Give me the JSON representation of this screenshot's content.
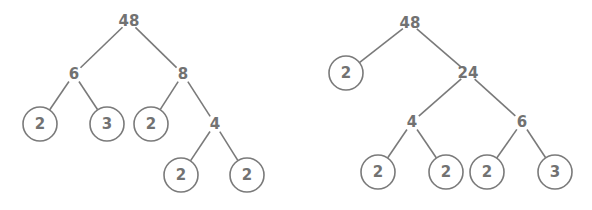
{
  "diagram": {
    "type": "factor-trees",
    "colors": {
      "stroke": "#7a7a7a",
      "text": "#727272",
      "background": "#ffffff"
    },
    "trees": [
      {
        "root": "48",
        "nodes": [
          {
            "id": "n0",
            "label": "48",
            "x": 129,
            "y": 21,
            "prime": false
          },
          {
            "id": "n1",
            "label": "6",
            "x": 74,
            "y": 74,
            "prime": false
          },
          {
            "id": "n2",
            "label": "8",
            "x": 183,
            "y": 74,
            "prime": false
          },
          {
            "id": "n3",
            "label": "2",
            "x": 40,
            "y": 124,
            "prime": true
          },
          {
            "id": "n4",
            "label": "3",
            "x": 107,
            "y": 124,
            "prime": true
          },
          {
            "id": "n5",
            "label": "2",
            "x": 151,
            "y": 124,
            "prime": true
          },
          {
            "id": "n6",
            "label": "4",
            "x": 215,
            "y": 124,
            "prime": false
          },
          {
            "id": "n7",
            "label": "2",
            "x": 181,
            "y": 175,
            "prime": true
          },
          {
            "id": "n8",
            "label": "2",
            "x": 247,
            "y": 175,
            "prime": true
          }
        ],
        "edges": [
          [
            "n0",
            "n1"
          ],
          [
            "n0",
            "n2"
          ],
          [
            "n1",
            "n3"
          ],
          [
            "n1",
            "n4"
          ],
          [
            "n2",
            "n5"
          ],
          [
            "n2",
            "n6"
          ],
          [
            "n6",
            "n7"
          ],
          [
            "n6",
            "n8"
          ]
        ]
      },
      {
        "root": "48",
        "nodes": [
          {
            "id": "m0",
            "label": "48",
            "x": 410,
            "y": 23,
            "prime": false
          },
          {
            "id": "m1",
            "label": "2",
            "x": 346,
            "y": 73,
            "prime": true
          },
          {
            "id": "m2",
            "label": "24",
            "x": 468,
            "y": 73,
            "prime": false
          },
          {
            "id": "m3",
            "label": "4",
            "x": 412,
            "y": 122,
            "prime": false
          },
          {
            "id": "m4",
            "label": "6",
            "x": 522,
            "y": 122,
            "prime": false
          },
          {
            "id": "m5",
            "label": "2",
            "x": 378,
            "y": 172,
            "prime": true
          },
          {
            "id": "m6",
            "label": "2",
            "x": 446,
            "y": 172,
            "prime": true
          },
          {
            "id": "m7",
            "label": "2",
            "x": 487,
            "y": 172,
            "prime": true
          },
          {
            "id": "m8",
            "label": "3",
            "x": 555,
            "y": 172,
            "prime": true
          }
        ],
        "edges": [
          [
            "m0",
            "m1"
          ],
          [
            "m0",
            "m2"
          ],
          [
            "m2",
            "m3"
          ],
          [
            "m2",
            "m4"
          ],
          [
            "m3",
            "m5"
          ],
          [
            "m3",
            "m6"
          ],
          [
            "m4",
            "m7"
          ],
          [
            "m4",
            "m8"
          ]
        ]
      }
    ]
  }
}
